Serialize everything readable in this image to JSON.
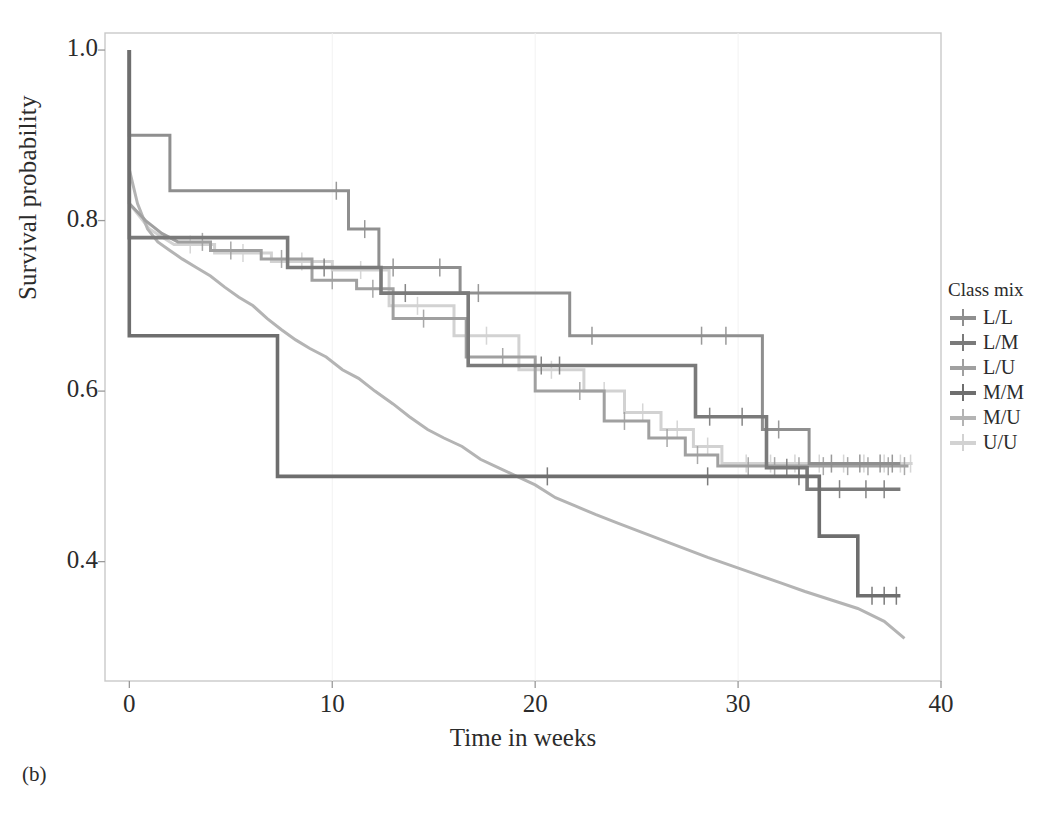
{
  "caption": "(b)",
  "legend": {
    "title": "Class mix",
    "items": [
      {
        "label": "L/L",
        "color": "#8f8f8f"
      },
      {
        "label": "L/M",
        "color": "#7a7a7a"
      },
      {
        "label": "L/U",
        "color": "#a0a0a0"
      },
      {
        "label": "M/M",
        "color": "#6e6e6e"
      },
      {
        "label": "M/U",
        "color": "#b4b4b4"
      },
      {
        "label": "U/U",
        "color": "#d2d2d2"
      }
    ]
  },
  "axes": {
    "x_title": "Time in weeks",
    "y_title": "Survival probability",
    "x_ticks": [
      "0",
      "10",
      "20",
      "30",
      "40"
    ],
    "y_ticks": [
      "1.0",
      "0.8",
      "0.6",
      "0.4"
    ]
  },
  "chart_data": {
    "type": "line",
    "subtype": "kaplan-meier-step",
    "title": "",
    "xlabel": "Time in weeks",
    "ylabel": "Survival probability",
    "xlim": [
      -1.2,
      40
    ],
    "ylim": [
      0.26,
      1.02
    ],
    "grid": false,
    "legend_position": "right",
    "legend_title": "Class mix",
    "series": [
      {
        "name": "L/L",
        "color": "#8f8f8f",
        "steps": [
          [
            0,
            1.0
          ],
          [
            0,
            0.9
          ],
          [
            2.0,
            0.9
          ],
          [
            2.0,
            0.835
          ],
          [
            10.8,
            0.835
          ],
          [
            10.8,
            0.79
          ],
          [
            12.3,
            0.79
          ],
          [
            12.3,
            0.745
          ],
          [
            16.3,
            0.745
          ],
          [
            16.3,
            0.715
          ],
          [
            21.7,
            0.715
          ],
          [
            21.7,
            0.665
          ],
          [
            31.2,
            0.665
          ],
          [
            31.2,
            0.555
          ],
          [
            33.5,
            0.555
          ],
          [
            33.5,
            0.515
          ],
          [
            38.0,
            0.515
          ]
        ],
        "censor_times": [
          10.2,
          11.6,
          13.0,
          15.3,
          17.2,
          22.8,
          28.2,
          29.4,
          32.0,
          34.6,
          36.0,
          37.0,
          37.6
        ]
      },
      {
        "name": "L/M",
        "color": "#7a7a7a",
        "steps": [
          [
            0,
            1.0
          ],
          [
            0,
            0.78
          ],
          [
            7.8,
            0.78
          ],
          [
            7.8,
            0.745
          ],
          [
            12.4,
            0.745
          ],
          [
            12.4,
            0.715
          ],
          [
            16.7,
            0.715
          ],
          [
            16.7,
            0.63
          ],
          [
            27.9,
            0.63
          ],
          [
            27.9,
            0.57
          ],
          [
            31.4,
            0.57
          ],
          [
            31.4,
            0.51
          ],
          [
            33.4,
            0.51
          ],
          [
            33.4,
            0.485
          ],
          [
            38.0,
            0.485
          ]
        ],
        "censor_times": [
          9.6,
          13.6,
          20.3,
          21.2,
          28.6,
          30.2,
          32.4,
          35.0,
          36.3,
          37.2
        ]
      },
      {
        "name": "L/U",
        "color": "#a0a0a0",
        "steps": [
          [
            0,
            1.0
          ],
          [
            0,
            0.82
          ],
          [
            0.8,
            0.8
          ],
          [
            1.6,
            0.785
          ],
          [
            2.4,
            0.775
          ],
          [
            4.0,
            0.775
          ],
          [
            4.0,
            0.765
          ],
          [
            6.5,
            0.765
          ],
          [
            6.5,
            0.755
          ],
          [
            9.0,
            0.755
          ],
          [
            9.0,
            0.73
          ],
          [
            11.2,
            0.73
          ],
          [
            11.2,
            0.72
          ],
          [
            13.0,
            0.72
          ],
          [
            13.0,
            0.685
          ],
          [
            16.6,
            0.685
          ],
          [
            16.6,
            0.64
          ],
          [
            20.0,
            0.64
          ],
          [
            20.0,
            0.6
          ],
          [
            23.4,
            0.6
          ],
          [
            23.4,
            0.565
          ],
          [
            25.6,
            0.565
          ],
          [
            25.6,
            0.545
          ],
          [
            27.4,
            0.545
          ],
          [
            27.4,
            0.525
          ],
          [
            29.0,
            0.525
          ],
          [
            29.0,
            0.512
          ],
          [
            38.4,
            0.512
          ]
        ],
        "censor_times": [
          3.6,
          5.0,
          7.5,
          10.0,
          12.0,
          14.5,
          18.4,
          22.2,
          24.4,
          26.5,
          28.0,
          30.5,
          31.8,
          33.0,
          34.2,
          35.4,
          36.4,
          37.4,
          38.2
        ]
      },
      {
        "name": "M/M",
        "color": "#6e6e6e",
        "steps": [
          [
            0,
            1.0
          ],
          [
            0,
            0.665
          ],
          [
            7.3,
            0.665
          ],
          [
            7.3,
            0.5
          ],
          [
            34.0,
            0.5
          ],
          [
            34.0,
            0.43
          ],
          [
            35.9,
            0.43
          ],
          [
            35.9,
            0.36
          ],
          [
            38.0,
            0.36
          ]
        ],
        "censor_times": [
          20.6,
          28.5,
          33.0,
          36.6,
          37.2,
          37.8
        ]
      },
      {
        "name": "M/U",
        "color": "#b4b4b4",
        "steps": [
          [
            0,
            1.0
          ],
          [
            0,
            0.86
          ],
          [
            0.4,
            0.82
          ],
          [
            0.9,
            0.79
          ],
          [
            1.4,
            0.775
          ],
          [
            2.0,
            0.765
          ],
          [
            2.6,
            0.755
          ],
          [
            3.3,
            0.745
          ],
          [
            4.0,
            0.735
          ],
          [
            4.7,
            0.722
          ],
          [
            5.4,
            0.71
          ],
          [
            6.1,
            0.7
          ],
          [
            6.8,
            0.685
          ],
          [
            7.5,
            0.672
          ],
          [
            8.2,
            0.66
          ],
          [
            8.9,
            0.65
          ],
          [
            9.7,
            0.64
          ],
          [
            10.5,
            0.625
          ],
          [
            11.3,
            0.615
          ],
          [
            12.1,
            0.6
          ],
          [
            13.0,
            0.585
          ],
          [
            13.8,
            0.57
          ],
          [
            14.7,
            0.555
          ],
          [
            15.5,
            0.545
          ],
          [
            16.4,
            0.535
          ],
          [
            17.3,
            0.52
          ],
          [
            18.2,
            0.51
          ],
          [
            19.1,
            0.5
          ],
          [
            20.0,
            0.49
          ],
          [
            21.0,
            0.475
          ],
          [
            22.0,
            0.465
          ],
          [
            23.0,
            0.455
          ],
          [
            24.1,
            0.445
          ],
          [
            25.2,
            0.435
          ],
          [
            26.3,
            0.425
          ],
          [
            27.4,
            0.415
          ],
          [
            28.5,
            0.405
          ],
          [
            29.7,
            0.395
          ],
          [
            30.9,
            0.385
          ],
          [
            32.1,
            0.375
          ],
          [
            33.3,
            0.365
          ],
          [
            34.6,
            0.355
          ],
          [
            35.9,
            0.345
          ],
          [
            37.2,
            0.33
          ],
          [
            38.2,
            0.31
          ]
        ],
        "censor_times": []
      },
      {
        "name": "U/U",
        "color": "#d2d2d2",
        "steps": [
          [
            0,
            1.0
          ],
          [
            0,
            0.82
          ],
          [
            1.0,
            0.79
          ],
          [
            2.2,
            0.772
          ],
          [
            4.2,
            0.772
          ],
          [
            4.2,
            0.762
          ],
          [
            7.0,
            0.762
          ],
          [
            7.0,
            0.752
          ],
          [
            10.0,
            0.752
          ],
          [
            10.0,
            0.742
          ],
          [
            12.8,
            0.742
          ],
          [
            12.8,
            0.7
          ],
          [
            16.0,
            0.7
          ],
          [
            16.0,
            0.665
          ],
          [
            19.2,
            0.665
          ],
          [
            19.2,
            0.625
          ],
          [
            22.4,
            0.625
          ],
          [
            22.4,
            0.6
          ],
          [
            24.4,
            0.6
          ],
          [
            24.4,
            0.575
          ],
          [
            26.2,
            0.575
          ],
          [
            26.2,
            0.555
          ],
          [
            27.8,
            0.555
          ],
          [
            27.8,
            0.535
          ],
          [
            29.2,
            0.535
          ],
          [
            29.2,
            0.515
          ],
          [
            38.6,
            0.515
          ]
        ],
        "censor_times": [
          3.0,
          5.6,
          8.5,
          11.4,
          14.2,
          17.6,
          20.8,
          23.4,
          25.3,
          27.0,
          28.5,
          30.4,
          31.6,
          32.8,
          34.0,
          35.2,
          36.2,
          37.2,
          38.0,
          38.5
        ]
      }
    ]
  },
  "plot": {
    "frame_color": "#c9c9c9",
    "background": "#ffffff"
  }
}
